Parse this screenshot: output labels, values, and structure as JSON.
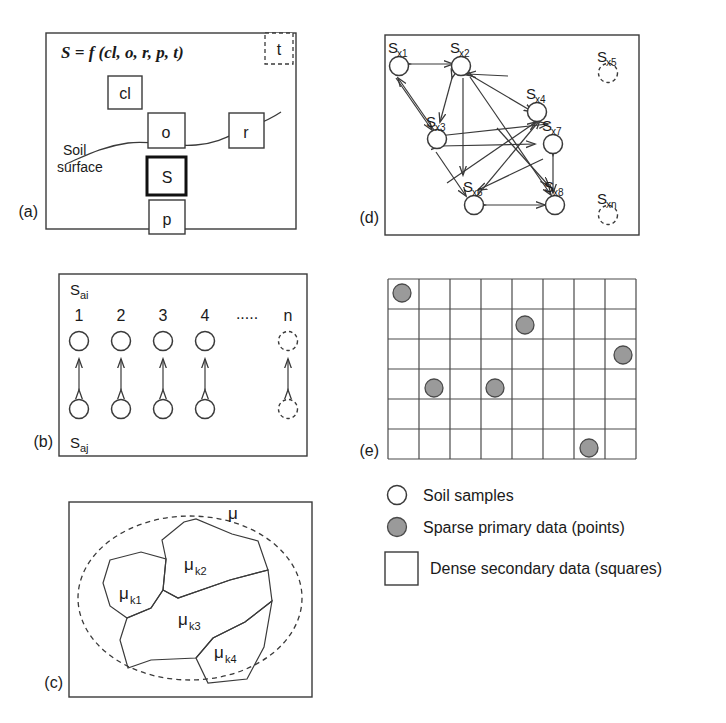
{
  "figure": {
    "panels": [
      {
        "id": "a",
        "label": "(a)"
      },
      {
        "id": "b",
        "label": "(b)"
      },
      {
        "id": "c",
        "label": "(c)"
      },
      {
        "id": "d",
        "label": "(d)"
      },
      {
        "id": "e",
        "label": "(e)"
      }
    ]
  },
  "panel_a": {
    "equation": "S = f (cl, o, r, p, t)",
    "boxes": [
      {
        "name": "t",
        "label": "t",
        "style": "dashed"
      },
      {
        "name": "cl",
        "label": "cl",
        "style": "solid"
      },
      {
        "name": "o",
        "label": "o",
        "style": "solid"
      },
      {
        "name": "r",
        "label": "r",
        "style": "solid"
      },
      {
        "name": "s",
        "label": "S",
        "style": "bold"
      },
      {
        "name": "p",
        "label": "p",
        "style": "solid"
      }
    ],
    "annotation_line1": "Soil",
    "annotation_line2": "surface"
  },
  "panel_b": {
    "top_label": "S",
    "top_sub": "ai",
    "bottom_label": "S",
    "bottom_sub": "aj",
    "columns": [
      "1",
      "2",
      "3",
      "4",
      ".....",
      "n"
    ]
  },
  "panel_c": {
    "outer_label": "μ",
    "regions": [
      {
        "base": "μ",
        "sub": "k1"
      },
      {
        "base": "μ",
        "sub": "k2"
      },
      {
        "base": "μ",
        "sub": "k3"
      },
      {
        "base": "μ",
        "sub": "k4"
      }
    ]
  },
  "panel_d": {
    "nodes": [
      {
        "base": "S",
        "sub": "x1",
        "style": "solid"
      },
      {
        "base": "S",
        "sub": "x2",
        "style": "solid"
      },
      {
        "base": "S",
        "sub": "x3",
        "style": "solid"
      },
      {
        "base": "S",
        "sub": "x4",
        "style": "solid"
      },
      {
        "base": "S",
        "sub": "x5",
        "style": "dashed"
      },
      {
        "base": "S",
        "sub": "x6",
        "style": "solid"
      },
      {
        "base": "S",
        "sub": "x7",
        "style": "solid"
      },
      {
        "base": "S",
        "sub": "x8",
        "style": "solid"
      },
      {
        "base": "S",
        "sub": "xn",
        "style": "dashed"
      }
    ]
  },
  "panel_e": {
    "grid_columns": 8,
    "grid_rows": 6,
    "points": [
      {
        "row": 1,
        "col": 1
      },
      {
        "row": 2,
        "col": 5
      },
      {
        "row": 3,
        "col": 8
      },
      {
        "row": 4,
        "col": 2
      },
      {
        "row": 4,
        "col": 4
      },
      {
        "row": 6,
        "col": 7
      }
    ]
  },
  "legend": {
    "items": [
      {
        "symbol": "open-circle",
        "label": "Soil samples"
      },
      {
        "symbol": "filled-circle",
        "label": "Sparse primary data (points)"
      },
      {
        "symbol": "open-square",
        "label": "Dense secondary data (squares)"
      }
    ]
  },
  "colors": {
    "stroke": "#3a3a3a",
    "point_fill": "#9a9a9a",
    "background": "#ffffff"
  }
}
